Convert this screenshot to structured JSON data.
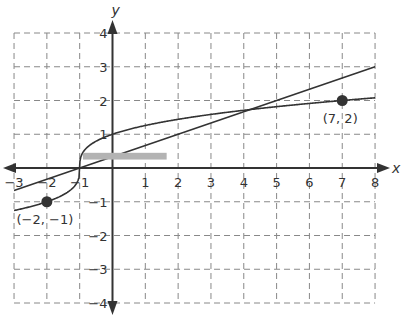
{
  "chart_data": {
    "type": "line",
    "title": "",
    "xlabel": "x",
    "ylabel": "y",
    "xlim": [
      -3,
      8
    ],
    "ylim": [
      -4,
      4
    ],
    "grid": true,
    "x_ticks": [
      "−3",
      "−2",
      "−1",
      "1",
      "2",
      "3",
      "4",
      "5",
      "6",
      "7",
      "8"
    ],
    "x_tick_values": [
      -3,
      -2,
      -1,
      1,
      2,
      3,
      4,
      5,
      6,
      7,
      8
    ],
    "y_ticks": [
      "4",
      "3",
      "2",
      "1",
      "−1",
      "−2",
      "−3",
      "−4"
    ],
    "y_tick_values": [
      4,
      3,
      2,
      1,
      -1,
      -2,
      -3,
      -4
    ],
    "series": [
      {
        "name": "curve",
        "equation": "y = cbrt(x + 1)",
        "x_range": [
          -3,
          8
        ]
      },
      {
        "name": "line",
        "equation": "y = (x + 1) / 3",
        "x_range": [
          -3,
          8
        ]
      }
    ],
    "points": [
      {
        "label": "(−2, −1)",
        "x": -2,
        "y": -1
      },
      {
        "label": "(7, 2)",
        "x": 7,
        "y": 2
      }
    ],
    "annotations": [
      {
        "type": "gray-redaction-bar",
        "x_range": [
          -0.9,
          1.65
        ],
        "y_range": [
          0.25,
          0.45
        ]
      }
    ]
  },
  "colors": {
    "axis": "#333333",
    "grid": "#888888",
    "curve": "#333333",
    "redaction": "#b3b3b3"
  }
}
